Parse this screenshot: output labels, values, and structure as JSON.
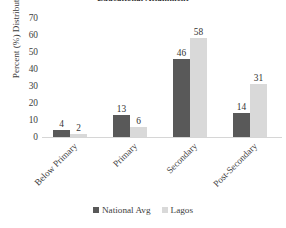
{
  "chart_data": {
    "type": "bar",
    "title": "Educational Attainment",
    "xlabel": "",
    "ylabel": "Percent (%) Distribution",
    "categories": [
      "Below Primary",
      "Primary",
      "Secondary",
      "Post-Secondary"
    ],
    "series": [
      {
        "name": "National Avg",
        "color": "#595959",
        "values": [
          4,
          13,
          46,
          14
        ]
      },
      {
        "name": "Lagos",
        "color": "#d9d9d9",
        "values": [
          2,
          6,
          58,
          31
        ]
      }
    ],
    "ylim": [
      0,
      70
    ],
    "yticks": [
      70,
      60,
      50,
      40,
      30,
      20,
      10,
      0
    ],
    "ytick_labels": [
      "70",
      "60",
      "50",
      "40",
      "30",
      "20",
      "10",
      "0"
    ],
    "grid": false,
    "legend_position": "bottom-center",
    "data_labels": true,
    "category_label_rotation": -45,
    "background_color": "#ffffff",
    "axis_color": "#d6d6d6",
    "text_color": "#3d3d3d"
  }
}
